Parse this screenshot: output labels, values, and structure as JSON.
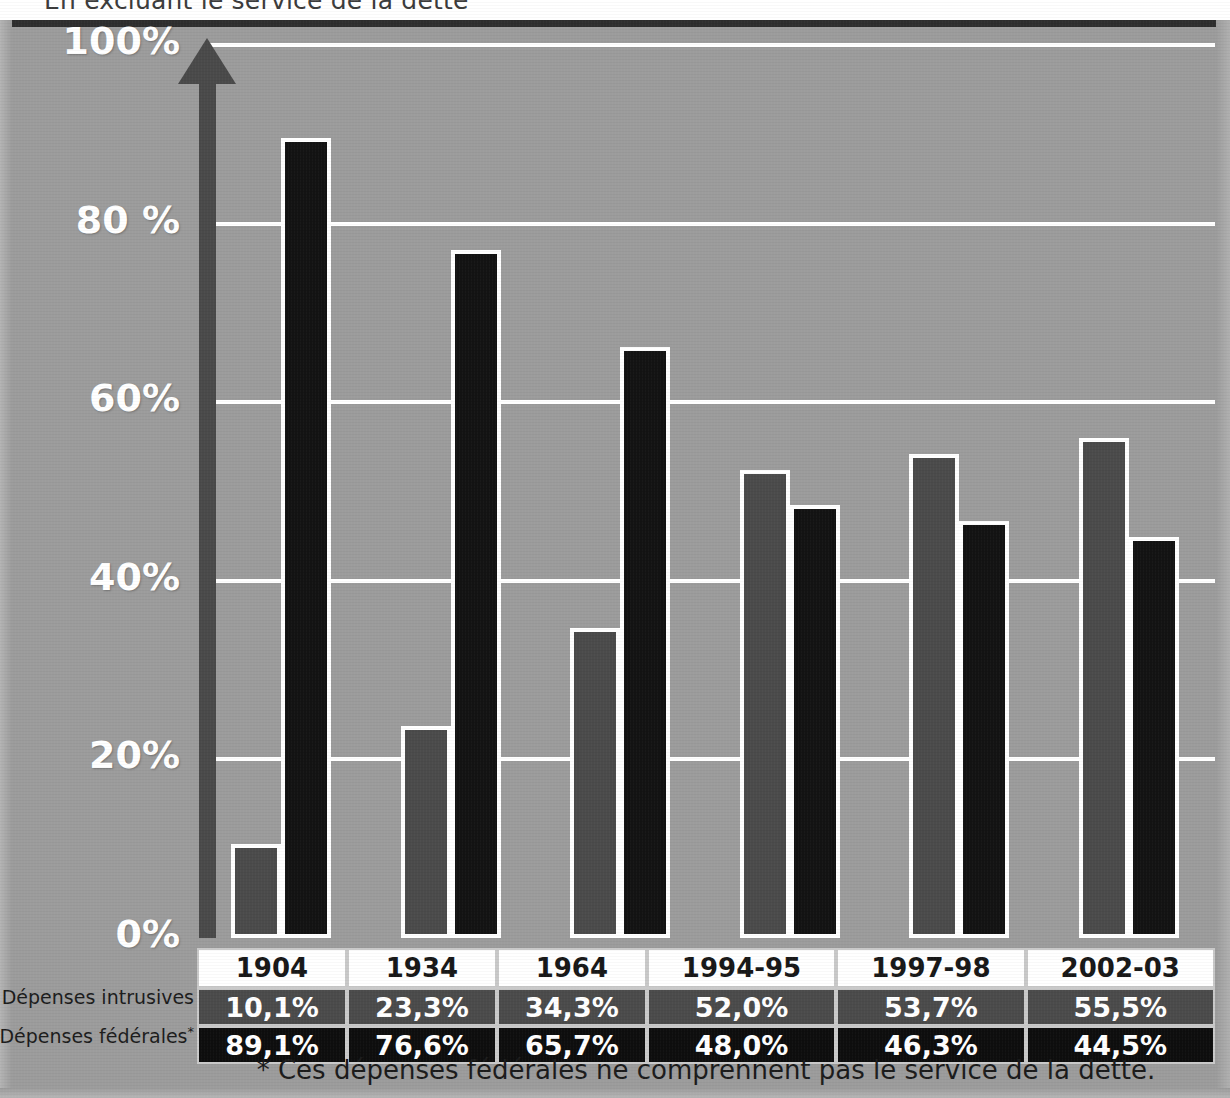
{
  "title": "En excluant le service de la dette",
  "colors": {
    "background": "#9c9c9c",
    "gridline": "#ffffff",
    "axis": "#4a4a4a",
    "series_intrusives": "#4b4b4b",
    "series_federales": "#131313",
    "header_cell": "#ffffff",
    "text_light": "#ffffff",
    "text_dark": "#1b1b1b"
  },
  "row_labels": {
    "intrusives": "Dépenses intrusives",
    "federales": "Dépenses fédérales",
    "federales_marker": "*"
  },
  "footnote": "* Ces dépenses fédérales ne comprennent pas le service de la dette.",
  "chart_data": {
    "type": "bar",
    "title": "En excluant le service de la dette",
    "xlabel": "",
    "ylabel": "",
    "ylim": [
      0,
      100
    ],
    "grid": true,
    "legend_position": "table-below",
    "ytick_labels": [
      "100%",
      "80 %",
      "60%",
      "40%",
      "20%",
      "0%"
    ],
    "ytick_values": [
      100,
      80,
      60,
      40,
      20,
      0
    ],
    "categories": [
      "1904",
      "1934",
      "1964",
      "1994-95",
      "1997-98",
      "2002-03"
    ],
    "series": [
      {
        "name": "Dépenses intrusives",
        "color": "#4b4b4b",
        "values": [
          10.1,
          23.3,
          34.3,
          52.0,
          53.7,
          55.5
        ],
        "labels": [
          "10,1%",
          "23,3%",
          "34,3%",
          "52,0%",
          "53,7%",
          "55,5%"
        ]
      },
      {
        "name": "Dépenses fédérales",
        "color": "#131313",
        "values": [
          89.1,
          76.6,
          65.7,
          48.0,
          46.3,
          44.5
        ],
        "labels": [
          "89,1%",
          "76,6%",
          "65,7%",
          "48,0%",
          "46,3%",
          "44,5%"
        ]
      }
    ]
  }
}
